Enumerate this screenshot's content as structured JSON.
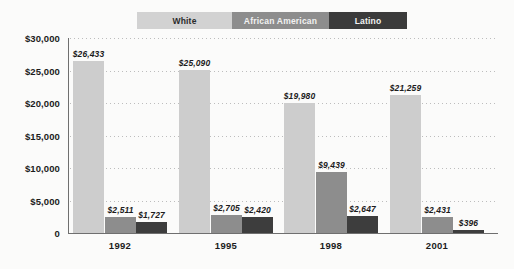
{
  "chart_data": {
    "type": "bar",
    "title": "",
    "xlabel": "",
    "ylabel": "",
    "categories": [
      "1992",
      "1995",
      "1998",
      "2001"
    ],
    "series": [
      {
        "name": "White",
        "color": "#cdcdcd",
        "values": [
          26433,
          25090,
          19980,
          21259
        ],
        "labels": [
          "$26,433",
          "$25,090",
          "$19,980",
          "$21,259"
        ]
      },
      {
        "name": "African American",
        "color": "#8d8d8d",
        "values": [
          2511,
          2705,
          9439,
          2431
        ],
        "labels": [
          "$2,511",
          "$2,705",
          "$9,439",
          "$2,431"
        ]
      },
      {
        "name": "Latino",
        "color": "#3d3d3d",
        "values": [
          1727,
          2420,
          2647,
          396
        ],
        "labels": [
          "$1,727",
          "$2,420",
          "$2,647",
          "$396"
        ]
      }
    ],
    "ylim": [
      0,
      30000
    ],
    "yticks": [
      0,
      5000,
      10000,
      15000,
      20000,
      25000,
      30000
    ],
    "ytick_labels": [
      "0",
      "$5,000",
      "$10,000",
      "$15,000",
      "$20,000",
      "$25,000",
      "$30,000"
    ],
    "grid": true,
    "legend_position": "top-center"
  },
  "legend": {
    "items": [
      {
        "label": "White",
        "color": "#d2d2d2"
      },
      {
        "label": "African American",
        "color": "#8d8d8d"
      },
      {
        "label": "Latino",
        "color": "#3b3b3b"
      }
    ]
  }
}
